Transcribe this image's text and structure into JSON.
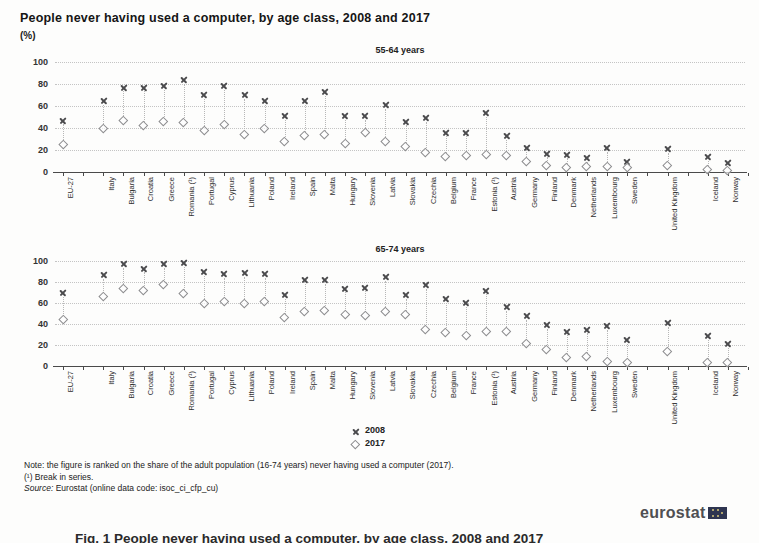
{
  "title": "People never having used a computer, by age class, 2008 and 2017",
  "unit": "(%)",
  "legend": [
    {
      "symbol": "x-marker",
      "label": "2008"
    },
    {
      "symbol": "diamond-marker",
      "label": "2017"
    }
  ],
  "notes": {
    "line1": "Note: the figure is ranked on the share of the adult population (16-74 years) never having used a computer (2017).",
    "line2": "(¹) Break in series.",
    "source_label": "Source:",
    "source_text": " Eurostat (online data code: isoc_ci_cfp_cu)"
  },
  "logo_text": "eurostat",
  "caption_partial": "Fig. 1  People never having used a computer, by age class, 2008 and 2017",
  "colors": {
    "marker_2008": "#4c4c4e",
    "marker_2017": "#8d8d8f",
    "gridline": "#c4c4c4",
    "axis": "#4a4a4a",
    "logo_flag": "#2e3550"
  },
  "chart_data": [
    {
      "type": "scatter",
      "title": "55-64 years",
      "ylabel": "%",
      "ylim": [
        0,
        100
      ],
      "yticks": [
        0,
        20,
        40,
        60,
        80,
        100
      ],
      "grid": true,
      "categories": [
        "EU-27",
        "Italy",
        "Bulgaria",
        "Croatia",
        "Greece",
        "Romania (¹)",
        "Portugal",
        "Cyprus",
        "Lithuania",
        "Poland",
        "Ireland",
        "Spain",
        "Malta",
        "Hungary",
        "Slovenia",
        "Latvia",
        "Slovakia",
        "Czechia",
        "Belgium",
        "France",
        "Estonia (¹)",
        "Austria",
        "Germany",
        "Finland",
        "Denmark",
        "Netherlands",
        "Luxembourg",
        "Sweden",
        "United Kingdom",
        "Iceland",
        "Norway"
      ],
      "gap_before": [
        "Italy",
        "United Kingdom",
        "Iceland"
      ],
      "series": [
        {
          "name": "2008",
          "marker": "x",
          "values": [
            47,
            65,
            77,
            77,
            78,
            84,
            70,
            78,
            70,
            65,
            51,
            65,
            73,
            51,
            51,
            61,
            46,
            49,
            36,
            36,
            54,
            33,
            22,
            17,
            16,
            13,
            22,
            9,
            21,
            14,
            8
          ]
        },
        {
          "name": "2017",
          "marker": "diamond",
          "values": [
            25,
            40,
            47,
            42,
            46,
            45,
            38,
            43,
            34,
            40,
            28,
            33,
            34,
            26,
            36,
            28,
            23,
            18,
            14,
            15,
            16,
            15,
            10,
            6,
            4,
            5,
            5,
            4,
            6,
            2,
            1
          ]
        }
      ]
    },
    {
      "type": "scatter",
      "title": "65-74 years",
      "ylabel": "%",
      "ylim": [
        0,
        100
      ],
      "yticks": [
        0,
        20,
        40,
        60,
        80,
        100
      ],
      "grid": true,
      "categories": [
        "EU-27",
        "Italy",
        "Bulgaria",
        "Croatia",
        "Greece",
        "Romania (¹)",
        "Portugal",
        "Cyprus",
        "Lithuania",
        "Poland",
        "Ireland",
        "Spain",
        "Malta",
        "Hungary",
        "Slovenia",
        "Latvia",
        "Slovakia",
        "Czechia",
        "Belgium",
        "France",
        "Estonia (¹)",
        "Austria",
        "Germany",
        "Finland",
        "Denmark",
        "Netherlands",
        "Luxembourg",
        "Sweden",
        "United Kingdom",
        "Iceland",
        "Norway"
      ],
      "gap_before": [
        "Italy",
        "United Kingdom",
        "Iceland"
      ],
      "series": [
        {
          "name": "2008",
          "marker": "x",
          "values": [
            70,
            87,
            97,
            93,
            97,
            98,
            90,
            88,
            89,
            88,
            68,
            82,
            82,
            74,
            75,
            85,
            68,
            77,
            64,
            60,
            72,
            56,
            48,
            39,
            33,
            35,
            38,
            25,
            41,
            29,
            21
          ]
        },
        {
          "name": "2017",
          "marker": "diamond",
          "values": [
            44,
            66,
            74,
            72,
            78,
            69,
            60,
            61,
            60,
            61,
            46,
            52,
            53,
            49,
            48,
            52,
            49,
            35,
            32,
            29,
            33,
            33,
            21,
            16,
            8,
            9,
            4,
            3,
            14,
            3,
            3
          ]
        }
      ]
    }
  ]
}
